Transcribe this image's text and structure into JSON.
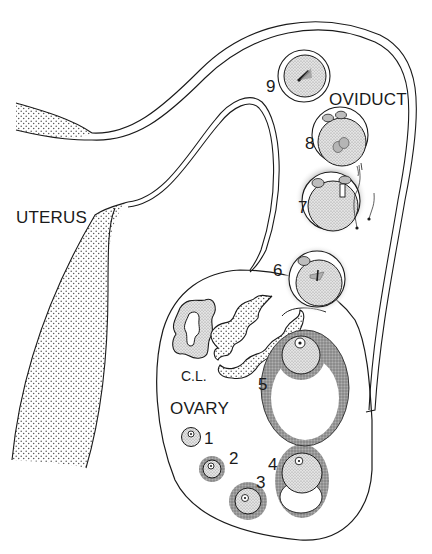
{
  "diagram": {
    "title": "",
    "labels": {
      "uterus": "UTERUS",
      "oviduct": "OVIDUCT",
      "ovary": "OVARY",
      "corpus_luteum": "C.L."
    },
    "stages": [
      {
        "number": "1",
        "description": "primordial follicle"
      },
      {
        "number": "2",
        "description": "primary follicle"
      },
      {
        "number": "3",
        "description": "secondary follicle"
      },
      {
        "number": "4",
        "description": "antral follicle"
      },
      {
        "number": "5",
        "description": "mature (Graafian) follicle"
      },
      {
        "number": "6",
        "description": "ovulated oocyte"
      },
      {
        "number": "7",
        "description": "fertilization"
      },
      {
        "number": "8",
        "description": "pronuclei"
      },
      {
        "number": "9",
        "description": "first cleavage"
      }
    ],
    "colors": {
      "line": "#1a1a1a",
      "stipple": "#9a9a9a",
      "granulosa": "#8c8c8c",
      "background": "#ffffff"
    }
  }
}
